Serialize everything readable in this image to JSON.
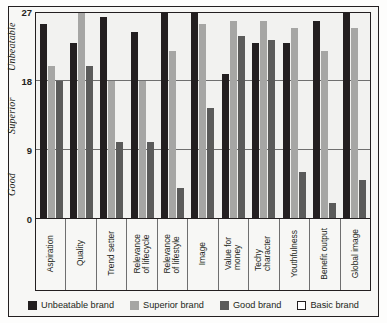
{
  "chart_data": {
    "type": "bar",
    "title": "",
    "xlabel": "",
    "ylabel": "",
    "ylim": [
      0,
      27
    ],
    "yticks": [
      0,
      9,
      18,
      27
    ],
    "grid": true,
    "legend_position": "bottom",
    "zone_labels": [
      {
        "text": "Good",
        "from": 0,
        "to": 9
      },
      {
        "text": "Superior",
        "from": 9,
        "to": 18
      },
      {
        "text": "Unbeatable",
        "from": 18,
        "to": 27
      }
    ],
    "categories": [
      "Aspiration",
      "Quality",
      "Trend setter",
      "Relevance\nof lifecycle",
      "Relevance\nof lifestyle",
      "Image",
      "Value for\nmoney",
      "Techy\ncharacter",
      "Youthfulness",
      "Benefit output",
      "Global image"
    ],
    "series": [
      {
        "name": "Unbeatable brand",
        "color": "#231f20",
        "values": [
          25.5,
          23,
          26.5,
          24.5,
          27,
          27,
          19,
          23,
          23,
          26,
          27
        ]
      },
      {
        "name": "Superior brand",
        "color": "#a6a6a4",
        "values": [
          20,
          27,
          18,
          18,
          22,
          25.5,
          26,
          26,
          25,
          22,
          25
        ]
      },
      {
        "name": "Good brand",
        "color": "#5b5b5a",
        "values": [
          18,
          20,
          10,
          10,
          4,
          14.5,
          24,
          23.5,
          6,
          2,
          5
        ]
      },
      {
        "name": "Basic brand",
        "color": "#ffffff",
        "values": [
          0,
          0,
          0,
          0,
          0,
          0,
          0,
          0,
          0,
          0,
          0
        ]
      }
    ]
  }
}
